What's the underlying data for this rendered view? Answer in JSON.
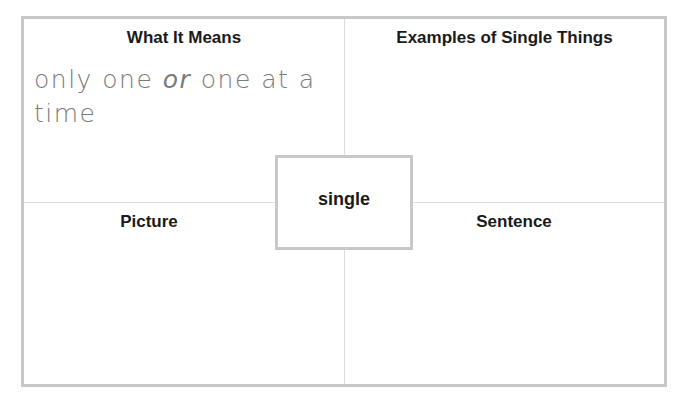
{
  "organizer": {
    "center_word": "single",
    "quadrants": {
      "top_left": {
        "heading": "What It Means",
        "content": {
          "part1": "only one ",
          "part2": "or",
          "part3": " one at a time"
        }
      },
      "top_right": {
        "heading": "Examples of Single Things",
        "content": ""
      },
      "bottom_left": {
        "heading": "Picture",
        "content": ""
      },
      "bottom_right": {
        "heading": "Sentence",
        "content": ""
      }
    }
  },
  "colors": {
    "border": "#c8c8c8",
    "divider": "#dcdcdc",
    "heading_text": "#1a1a1a",
    "handwriting_text": "#7a7a7a"
  }
}
